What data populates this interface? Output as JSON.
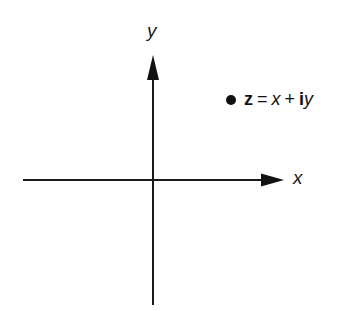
{
  "figure": {
    "type": "complex-plane-diagram",
    "background_color": "#ffffff",
    "stroke_color": "#1a1a1a",
    "marker_color": "#111111",
    "width": 361,
    "height": 311
  },
  "axes": {
    "x_label": "x",
    "y_label": "y",
    "origin": {
      "x": 153,
      "y": 180
    },
    "x_axis": {
      "start_x": 23,
      "end_x": 284,
      "y": 180
    },
    "y_axis": {
      "x": 153,
      "start_y": 55,
      "end_y": 305
    }
  },
  "annotation": {
    "marker_icon": "filled-dot",
    "variable": "z",
    "equals": "=",
    "real_part": "x",
    "plus": "+",
    "imaginary_unit": "i",
    "imaginary_part": "y",
    "full_text": "z = x + iy",
    "position": {
      "x": 233,
      "y": 101
    }
  }
}
